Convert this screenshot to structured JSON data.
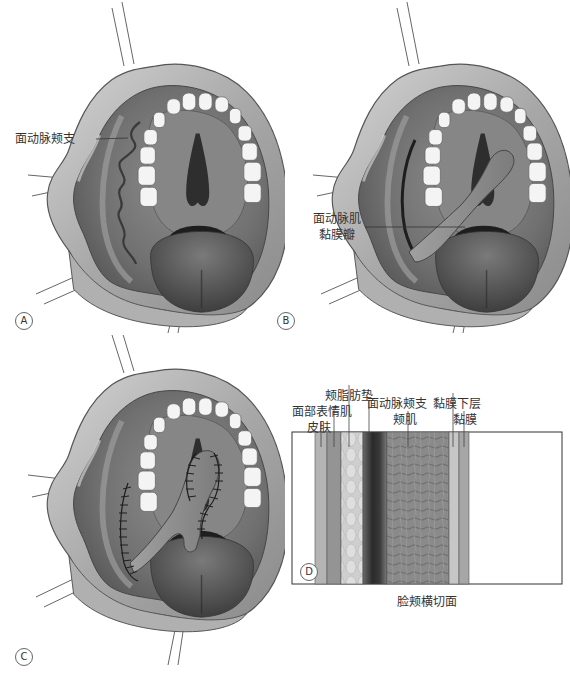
{
  "panels": {
    "A": {
      "letter": "A",
      "label": "面动脉颊支"
    },
    "B": {
      "letter": "B",
      "label_line1": "面动脉肌",
      "label_line2": "黏膜瓣"
    },
    "C": {
      "letter": "C"
    },
    "D": {
      "letter": "D",
      "caption": "脸颊横切面",
      "layers": {
        "skin": "皮肤",
        "facial_expression_muscle": "面部表情肌",
        "buccal_fat_pad": "颊脂肪垫",
        "facial_artery_buccal_branch": "面动脉颊支",
        "buccinator": "颊肌",
        "submucosa": "黏膜下层",
        "mucosa": "黏膜"
      }
    }
  },
  "colors": {
    "lip": "#b8b8b8",
    "lip_dark": "#6e6e6e",
    "mucosa": "#8c8c8c",
    "palate": "#7a7a7a",
    "teeth": "#f4f4f4",
    "tongue": "#5a5a5a",
    "throat": "#1e1e1e",
    "artery": "#4a4a4a"
  }
}
